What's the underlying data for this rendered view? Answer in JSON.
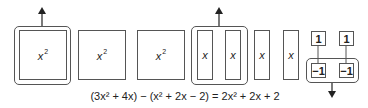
{
  "tiles": {
    "x_squared": [
      "x",
      "x",
      "x"
    ],
    "x_squared_exp": "2",
    "x_bars": [
      "x",
      "x",
      "x",
      "x"
    ],
    "positive_units": [
      "1",
      "1"
    ],
    "negative_units": [
      "−1",
      "−1"
    ]
  },
  "equation": {
    "text": "(3x² + 4x) − (x² + 2x − 2) = 2x² + 2x + 2"
  },
  "colors": {
    "stroke": "#555555",
    "background": "#ffffff"
  }
}
